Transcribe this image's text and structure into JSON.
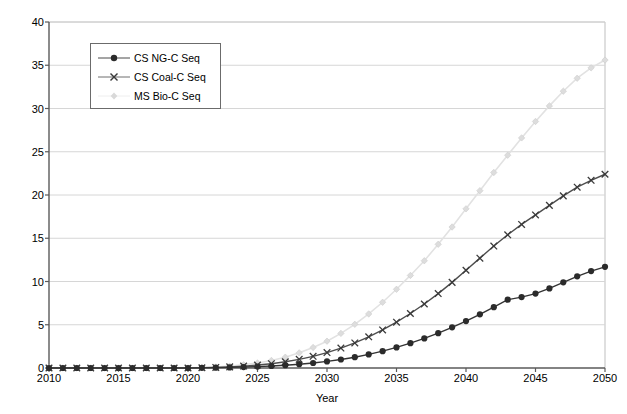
{
  "chart_data": {
    "type": "line",
    "title": "",
    "xlabel": "Year",
    "ylabel": "Cumulative metric tons of carbon dioxide (billions)",
    "xlim": [
      2010,
      2050
    ],
    "ylim": [
      0,
      40
    ],
    "xticks": [
      2010,
      2015,
      2020,
      2025,
      2030,
      2035,
      2040,
      2045,
      2050
    ],
    "yticks": [
      0,
      5,
      10,
      15,
      20,
      25,
      30,
      35,
      40
    ],
    "xtick_labels": [
      "2010",
      "2015",
      "2020",
      "2025",
      "2030",
      "2035",
      "2040",
      "2045",
      "2050"
    ],
    "ytick_labels": [
      "0",
      "5",
      "10",
      "15",
      "20",
      "25",
      "30",
      "35",
      "40"
    ],
    "grid": "horizontal",
    "legend_position": "upper-left-inset",
    "x": [
      2010,
      2011,
      2012,
      2013,
      2014,
      2015,
      2016,
      2017,
      2018,
      2019,
      2020,
      2021,
      2022,
      2023,
      2024,
      2025,
      2026,
      2027,
      2028,
      2029,
      2030,
      2031,
      2032,
      2033,
      2034,
      2035,
      2036,
      2037,
      2038,
      2039,
      2040,
      2041,
      2042,
      2043,
      2044,
      2045,
      2046,
      2047,
      2048,
      2049,
      2050
    ],
    "series": [
      {
        "name": "CS NG-C Seq",
        "marker": "filled-circle",
        "color": "#2b2b2b",
        "values": [
          0,
          0,
          0,
          0,
          0,
          0,
          0,
          0,
          0,
          0,
          0,
          0.02,
          0.04,
          0.07,
          0.11,
          0.16,
          0.23,
          0.32,
          0.44,
          0.58,
          0.76,
          0.98,
          1.25,
          1.57,
          1.95,
          2.38,
          2.87,
          3.42,
          4.03,
          4.7,
          5.42,
          6.2,
          7.03,
          7.9,
          8.2,
          8.6,
          9.2,
          9.9,
          10.6,
          11.2,
          11.7
        ]
      },
      {
        "name": "CS Coal-C Seq",
        "marker": "x-cross",
        "color": "#3a3a3a",
        "values": [
          0,
          0,
          0,
          0,
          0,
          0,
          0,
          0,
          0,
          0,
          0,
          0.03,
          0.07,
          0.13,
          0.22,
          0.34,
          0.5,
          0.72,
          1.0,
          1.35,
          1.78,
          2.3,
          2.9,
          3.6,
          4.4,
          5.3,
          6.3,
          7.4,
          8.6,
          9.9,
          11.3,
          12.7,
          14.1,
          15.4,
          16.6,
          17.7,
          18.8,
          19.9,
          20.9,
          21.7,
          22.4
        ]
      },
      {
        "name": "MS Bio-C Seq",
        "marker": "diamond",
        "color": "#d4d4d4",
        "values": [
          0,
          0,
          0,
          0,
          0,
          0,
          0,
          0,
          0,
          0,
          0,
          0.05,
          0.12,
          0.22,
          0.37,
          0.58,
          0.87,
          1.25,
          1.75,
          2.37,
          3.1,
          4.0,
          5.05,
          6.25,
          7.6,
          9.1,
          10.7,
          12.4,
          14.3,
          16.3,
          18.4,
          20.5,
          22.6,
          24.6,
          26.6,
          28.5,
          30.3,
          32.0,
          33.5,
          34.7,
          35.6
        ]
      }
    ]
  },
  "legend": {
    "items": [
      {
        "label": "CS NG-C Seq"
      },
      {
        "label": "CS Coal-C Seq"
      },
      {
        "label": "MS Bio-C Seq"
      }
    ]
  }
}
